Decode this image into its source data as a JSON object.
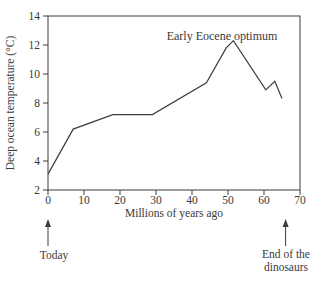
{
  "chart_data": {
    "type": "line",
    "title": "",
    "annotation": "Early Eocene optimum",
    "xlabel": "Millions of years ago",
    "ylabel": "Deep ocean temperature (°C)",
    "xlim": [
      0,
      70
    ],
    "ylim": [
      2,
      14
    ],
    "x_ticks": [
      0,
      10,
      20,
      30,
      40,
      50,
      60,
      70
    ],
    "y_ticks": [
      2,
      4,
      6,
      8,
      10,
      12,
      14
    ],
    "grid": false,
    "frame": "full-box",
    "legend": "none",
    "series": [
      {
        "name": "Deep ocean temperature",
        "points": [
          [
            0,
            3.1
          ],
          [
            7,
            6.2
          ],
          [
            18,
            7.2
          ],
          [
            29,
            7.2
          ],
          [
            44,
            9.4
          ],
          [
            49.5,
            11.8
          ],
          [
            51.5,
            12.3
          ],
          [
            60.5,
            8.9
          ],
          [
            63,
            9.5
          ],
          [
            65,
            8.3
          ]
        ]
      }
    ],
    "colors": {
      "line": "#3d3d3d",
      "axis": "#3d3d3d",
      "text": "#3a3a3a",
      "background": "#ffffff"
    }
  },
  "markers": {
    "today": {
      "x": 0,
      "label": "Today"
    },
    "end_of_dinosaurs": {
      "x": 66,
      "label_line1": "End of the",
      "label_line2": "dinosaurs"
    }
  }
}
